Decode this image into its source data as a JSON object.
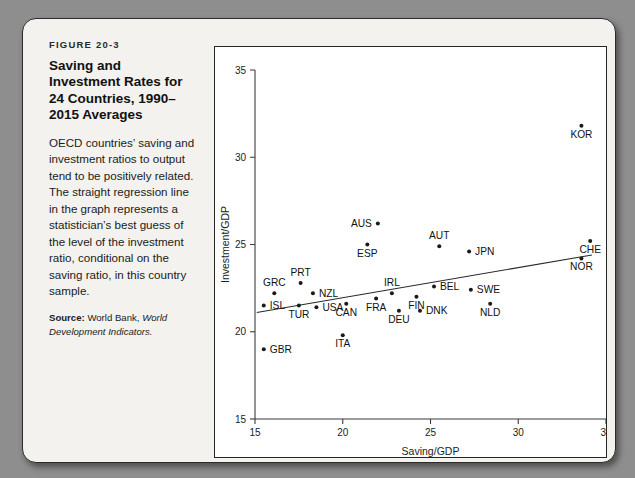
{
  "figure": {
    "label": "FIGURE 20-3",
    "title": "Saving and Investment Rates for 24 Countries, 1990–2015 Averages",
    "description": "OECD countries’ saving and investment ratios to output tend to be positively related. The straight regression line in the graph represents a statistician’s best guess of the level of the investment ratio, conditional on the saving ratio, in this country sample.",
    "source_label": "Source:",
    "source_text": "World Bank,",
    "source_italic": "World Development Indicators."
  },
  "chart_data": {
    "type": "scatter",
    "title": "",
    "xlabel": "Saving/GDP",
    "ylabel": "Investment/GDP",
    "xlim": [
      15,
      35
    ],
    "ylim": [
      15,
      35
    ],
    "xticks": [
      15,
      20,
      25,
      30,
      35
    ],
    "yticks": [
      15,
      20,
      25,
      30,
      35
    ],
    "grid": false,
    "legend": "none",
    "point_count": 24,
    "points": [
      {
        "label": "ISL",
        "x": 15.5,
        "y": 21.5,
        "label_pos": "right"
      },
      {
        "label": "GRC",
        "x": 16.1,
        "y": 22.2,
        "label_pos": "above"
      },
      {
        "label": "GBR",
        "x": 15.5,
        "y": 19.0,
        "label_pos": "right"
      },
      {
        "label": "TUR",
        "x": 17.5,
        "y": 21.5,
        "label_pos": "below"
      },
      {
        "label": "PRT",
        "x": 17.6,
        "y": 22.8,
        "label_pos": "above"
      },
      {
        "label": "USA",
        "x": 18.5,
        "y": 21.4,
        "label_pos": "right"
      },
      {
        "label": "NZL",
        "x": 18.3,
        "y": 22.2,
        "label_pos": "right"
      },
      {
        "label": "CAN",
        "x": 20.2,
        "y": 21.6,
        "label_pos": "below"
      },
      {
        "label": "ITA",
        "x": 20.0,
        "y": 19.8,
        "label_pos": "below"
      },
      {
        "label": "ESP",
        "x": 21.4,
        "y": 25.0,
        "label_pos": "below"
      },
      {
        "label": "AUS",
        "x": 22.0,
        "y": 26.2,
        "label_pos": "left"
      },
      {
        "label": "FRA",
        "x": 21.9,
        "y": 21.9,
        "label_pos": "below"
      },
      {
        "label": "IRL",
        "x": 22.8,
        "y": 22.2,
        "label_pos": "above"
      },
      {
        "label": "DEU",
        "x": 23.2,
        "y": 21.2,
        "label_pos": "below"
      },
      {
        "label": "FIN",
        "x": 24.2,
        "y": 22.0,
        "label_pos": "below"
      },
      {
        "label": "DNK",
        "x": 24.4,
        "y": 21.2,
        "label_pos": "right"
      },
      {
        "label": "BEL",
        "x": 25.2,
        "y": 22.6,
        "label_pos": "right"
      },
      {
        "label": "AUT",
        "x": 25.5,
        "y": 24.9,
        "label_pos": "above"
      },
      {
        "label": "NLD",
        "x": 28.4,
        "y": 21.6,
        "label_pos": "below"
      },
      {
        "label": "SWE",
        "x": 27.3,
        "y": 22.4,
        "label_pos": "right"
      },
      {
        "label": "JPN",
        "x": 27.2,
        "y": 24.6,
        "label_pos": "right"
      },
      {
        "label": "KOR",
        "x": 33.6,
        "y": 31.8,
        "label_pos": "below"
      },
      {
        "label": "CHE",
        "x": 34.1,
        "y": 25.2,
        "label_pos": "below"
      },
      {
        "label": "NOR",
        "x": 33.6,
        "y": 24.2,
        "label_pos": "below"
      }
    ],
    "regression_line": {
      "x_start": 15.1,
      "y_start": 21.1,
      "x_end": 34.2,
      "y_end": 24.4
    }
  }
}
